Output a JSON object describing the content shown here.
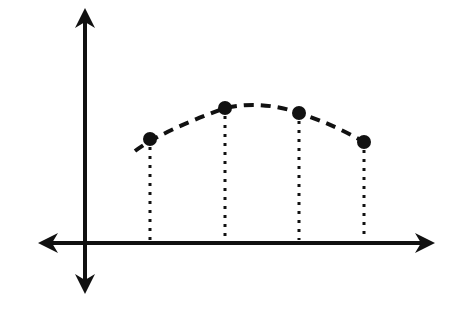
{
  "chart_data": {
    "type": "scatter",
    "title": "",
    "xlabel": "",
    "ylabel": "",
    "grid": false,
    "axes": "four-directional arrows (both axes extend in both directions)",
    "points": [
      {
        "x": 150,
        "y": 139
      },
      {
        "x": 225,
        "y": 108
      },
      {
        "x": 299,
        "y": 113
      },
      {
        "x": 364,
        "y": 142
      }
    ],
    "trend": "dashed concave-down curve fitting the points",
    "drop_lines": "dotted vertical lines from each point to the x-axis"
  },
  "colors": {
    "ink": "#111111",
    "background": "#ffffff"
  }
}
